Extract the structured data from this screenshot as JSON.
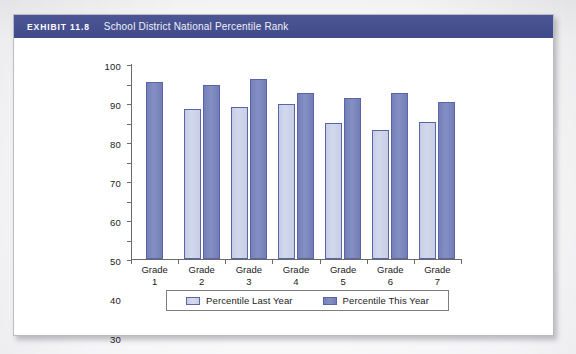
{
  "exhibit": {
    "number": "EXHIBIT 11.8",
    "title": "School District National Percentile Rank"
  },
  "chart_data": {
    "type": "bar",
    "title": "School District National Percentile Rank",
    "xlabel": "",
    "ylabel": "",
    "ylim": [
      0,
      100
    ],
    "yticks": [
      0,
      10,
      20,
      30,
      40,
      50,
      60,
      70,
      80,
      90,
      100
    ],
    "grid": false,
    "legend_position": "bottom",
    "categories": [
      "Grade 1",
      "Grade 2",
      "Grade 3",
      "Grade 4",
      "Grade 5",
      "Grade 6",
      "Grade 7"
    ],
    "category_lines": [
      [
        "Grade",
        "1"
      ],
      [
        "Grade",
        "2"
      ],
      [
        "Grade",
        "3"
      ],
      [
        "Grade",
        "4"
      ],
      [
        "Grade",
        "5"
      ],
      [
        "Grade",
        "6"
      ],
      [
        "Grade",
        "7"
      ]
    ],
    "series": [
      {
        "name": "Percentile Last Year",
        "color": "#ccd3e8",
        "values": [
          null,
          77,
          78,
          79.5,
          70,
          66,
          70.5
        ]
      },
      {
        "name": "Percentile This Year",
        "color": "#7b85bc",
        "values": [
          91,
          89,
          92.5,
          85,
          82.5,
          85,
          80.5
        ]
      }
    ]
  },
  "colors": {
    "header_band": "#47508f",
    "bar_last_year": "#ccd3e8",
    "bar_this_year": "#7b85bc",
    "bar_outline": "#5b64a6",
    "axis": "#6a6a6a"
  }
}
